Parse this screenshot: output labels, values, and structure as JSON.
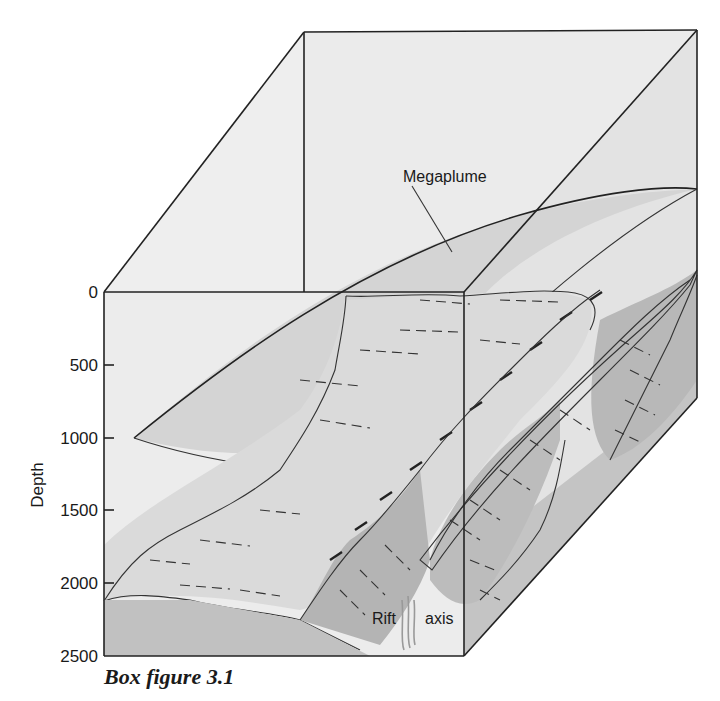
{
  "figure": {
    "caption": "Box figure 3.1",
    "type": "block-diagram"
  },
  "axis": {
    "label": "Depth",
    "ticks": [
      "0",
      "500",
      "1000",
      "1500",
      "2000",
      "2500"
    ],
    "tick_values": [
      0,
      500,
      1000,
      1500,
      2000,
      2500
    ],
    "range": [
      0,
      2500
    ]
  },
  "annotations": {
    "megaplume": "Megaplume",
    "rift_word1": "Rift",
    "rift_word2": "axis"
  },
  "colors": {
    "water_light": "#ececec",
    "water_side": "#e4e4e4",
    "plume": "#d2d2d2",
    "seafloor_upper": "#d9d9d9",
    "seafloor_dark": "#bdbdbd",
    "block_front": "#c3c3c3",
    "rift_wall_dark": "#b2b2b2",
    "rift_axis_lines": "#9a9a9a",
    "edge": "#222222"
  }
}
